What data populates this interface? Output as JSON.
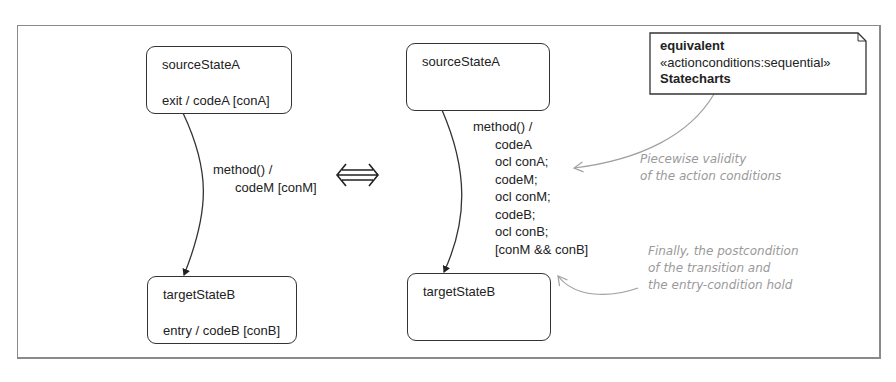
{
  "left_diagram": {
    "source_state": {
      "name": "sourceStateA",
      "action": "exit / codeA [conA]"
    },
    "target_state": {
      "name": "targetStateB",
      "action": "entry / codeB [conB]"
    },
    "transition": {
      "lines": [
        "method() /",
        "codeM [conM]"
      ]
    }
  },
  "equivalence_symbol": "⇔",
  "right_diagram": {
    "source_state": {
      "name": "sourceStateA"
    },
    "target_state": {
      "name": "targetStateB"
    },
    "transition": {
      "lines": [
        "method() /",
        "codeA",
        "ocl conA;",
        "codeM;",
        "ocl conM;",
        "codeB;",
        "ocl conB;",
        "[conM && conB]"
      ]
    }
  },
  "note": {
    "line1": "equivalent",
    "line2": "«actionconditions:sequential»",
    "line3": "Statecharts"
  },
  "comments": {
    "piecewise": [
      "Piecewise validity",
      "of the action conditions"
    ],
    "finally": [
      "Finally, the postcondition",
      "of the transition and",
      "the entry-condition hold"
    ]
  },
  "colors": {
    "line": "#333333",
    "comment": "#9a9a9a",
    "frame": "#8a8a8a"
  }
}
